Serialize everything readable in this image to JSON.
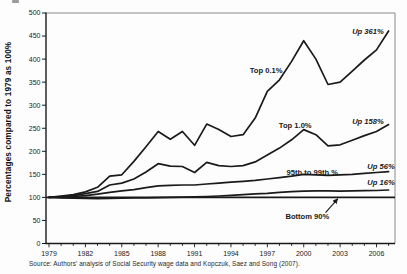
{
  "figure": {
    "source": "Source: Authors' analysis of Social Security wage data and Kopczuk, Saez and Song (2007)."
  },
  "chart_data": {
    "type": "line",
    "title": "",
    "xlabel": "",
    "ylabel": "Percentages compared to 1979 as 100%",
    "x_range": [
      1979,
      2007
    ],
    "ylim": [
      0,
      500
    ],
    "y_tick_step": 50,
    "x_tick_labels": [
      1979,
      1982,
      1985,
      1988,
      1991,
      1994,
      1997,
      2000,
      2003,
      2006
    ],
    "grid": false,
    "legend": "inline-annotations",
    "x": [
      1979,
      1980,
      1981,
      1982,
      1983,
      1984,
      1985,
      1986,
      1987,
      1988,
      1989,
      1990,
      1991,
      1992,
      1993,
      1994,
      1995,
      1996,
      1997,
      1998,
      1999,
      2000,
      2001,
      2002,
      2003,
      2004,
      2005,
      2006,
      2007
    ],
    "series": [
      {
        "name": "Top 0.1%",
        "growth_label": "Up 361%",
        "values": [
          100,
          103,
          106,
          112,
          122,
          146,
          149,
          178,
          210,
          243,
          226,
          243,
          213,
          259,
          247,
          232,
          236,
          272,
          330,
          355,
          395,
          440,
          400,
          345,
          350,
          374,
          398,
          420,
          461
        ]
      },
      {
        "name": "Top 1.0%",
        "growth_label": "Up 158%",
        "values": [
          100,
          102,
          104,
          108,
          113,
          127,
          131,
          140,
          155,
          173,
          168,
          167,
          154,
          176,
          169,
          167,
          169,
          177,
          192,
          207,
          225,
          247,
          236,
          212,
          214,
          224,
          234,
          243,
          258
        ]
      },
      {
        "name": "95th to 99th %",
        "growth_label": "Up 56%",
        "values": [
          100,
          101,
          102,
          104,
          107,
          111,
          114,
          117,
          121,
          125,
          126,
          127,
          127,
          129,
          131,
          133,
          135,
          137,
          140,
          143,
          146,
          150,
          149,
          148,
          149,
          150,
          152,
          154,
          156
        ]
      },
      {
        "name": "Bottom 90%",
        "growth_label": "Up 16%",
        "values": [
          100,
          99,
          98.5,
          98,
          97.5,
          98,
          98.5,
          99,
          99,
          99.5,
          100,
          100.5,
          101,
          102,
          103,
          104.5,
          106,
          107.5,
          109,
          111,
          112.5,
          113.5,
          114,
          114,
          113.5,
          114,
          114.5,
          115,
          116
        ]
      }
    ],
    "reference_line": {
      "value": 100
    },
    "annotations": [
      {
        "text": "Top 0.1%",
        "x": 1996.9,
        "y": 375,
        "anchor": "middle",
        "style": "bold"
      },
      {
        "text": "Up 361%",
        "x": 2006.6,
        "y": 460,
        "anchor": "end",
        "style": "bold-italic"
      },
      {
        "text": "Top 1.0%",
        "x": 1999.3,
        "y": 257,
        "anchor": "middle",
        "style": "bold"
      },
      {
        "text": "Up 158%",
        "x": 2006.6,
        "y": 264,
        "anchor": "end",
        "style": "bold-italic"
      },
      {
        "text": "95th to 99th %",
        "x": 2000.7,
        "y": 155,
        "anchor": "middle",
        "style": "bold"
      },
      {
        "text": "Up 56%",
        "x": 2007.5,
        "y": 167,
        "anchor": "end",
        "style": "bold-italic"
      },
      {
        "text": "Up 16%",
        "x": 2007.5,
        "y": 133,
        "anchor": "end",
        "style": "bold-italic"
      },
      {
        "text": "Bottom 90%",
        "x": 2000.3,
        "y": 58,
        "anchor": "middle",
        "style": "bold",
        "arrow": {
          "x1": 2001.8,
          "y1": 67,
          "x2": 2002.8,
          "y2": 97
        }
      }
    ],
    "colors": {
      "line": "#1a1a1a",
      "text": "#1a1a1a",
      "background": "#fdfdfd",
      "border_light": "#8a8a8a"
    }
  }
}
